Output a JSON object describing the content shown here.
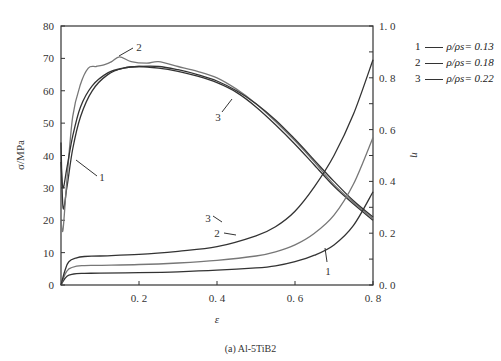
{
  "chart_data": {
    "type": "line",
    "title": "",
    "caption": "(a) Al-5TiB2",
    "xlabel": "ε",
    "ylabel": "σ/MPa",
    "y2label": "η",
    "xlim": [
      0,
      0.8
    ],
    "ylim": [
      0,
      80
    ],
    "y2lim": [
      0,
      1.0
    ],
    "xticks": [
      "0.2",
      "0.4",
      "0.6",
      "0.8"
    ],
    "yticks": [
      "0",
      "10",
      "20",
      "30",
      "40",
      "50",
      "60",
      "70",
      "80"
    ],
    "y2ticks": [
      "0.0",
      "0.2",
      "0.4",
      "0.6",
      "0.8",
      "1.0"
    ],
    "grid": false,
    "legend_position": "right-outside-top",
    "legend": [
      {
        "id": "1",
        "label": "ρ/ρs= 0.13"
      },
      {
        "id": "2",
        "label": "ρ/ρs= 0.18"
      },
      {
        "id": "3",
        "label": "ρ/ρs= 0.22"
      }
    ],
    "series": [
      {
        "name": "1 σ (ρ/ρs=0.13)",
        "axis": "left",
        "color": "#333333",
        "x": [
          0.0,
          0.005,
          0.015,
          0.03,
          0.05,
          0.08,
          0.12,
          0.16,
          0.2,
          0.25,
          0.3,
          0.35,
          0.4,
          0.45,
          0.5,
          0.55,
          0.6,
          0.65,
          0.7,
          0.75,
          0.8
        ],
        "values": [
          44,
          24,
          30,
          42,
          52,
          60,
          65,
          67,
          67.5,
          67,
          66,
          64.5,
          62.5,
          59.5,
          55,
          49.5,
          43.5,
          37,
          30.5,
          25,
          20
        ]
      },
      {
        "name": "2 σ (ρ/ρs=0.18)",
        "axis": "left",
        "color": "#777777",
        "x": [
          0.0,
          0.005,
          0.015,
          0.03,
          0.05,
          0.07,
          0.09,
          0.11,
          0.13,
          0.15,
          0.18,
          0.22,
          0.25,
          0.3,
          0.35,
          0.4,
          0.45,
          0.5,
          0.55,
          0.6,
          0.65,
          0.7,
          0.75,
          0.8
        ],
        "values": [
          20,
          17,
          32,
          52,
          62,
          67,
          67.5,
          68,
          69,
          70.5,
          69,
          68.5,
          69,
          67.5,
          66,
          64,
          60.5,
          56,
          50.5,
          44.5,
          38,
          31,
          25.5,
          20.5
        ]
      },
      {
        "name": "3 σ (ρ/ρs=0.22)",
        "axis": "left",
        "color": "#333333",
        "x": [
          0.0,
          0.005,
          0.015,
          0.03,
          0.05,
          0.08,
          0.12,
          0.16,
          0.2,
          0.25,
          0.3,
          0.35,
          0.4,
          0.45,
          0.5,
          0.55,
          0.6,
          0.65,
          0.7,
          0.75,
          0.8
        ],
        "values": [
          38,
          30,
          36,
          46,
          55,
          61.5,
          65.5,
          67,
          67.5,
          67.5,
          66.5,
          65,
          63,
          60,
          56,
          51,
          45,
          38.5,
          32,
          26,
          21
        ]
      },
      {
        "name": "1 η (ρ/ρs=0.13)",
        "axis": "right",
        "color": "#333333",
        "x": [
          0.0,
          0.01,
          0.02,
          0.04,
          0.06,
          0.1,
          0.2,
          0.3,
          0.4,
          0.5,
          0.55,
          0.6,
          0.65,
          0.7,
          0.75,
          0.8
        ],
        "values": [
          0.0,
          0.025,
          0.038,
          0.044,
          0.045,
          0.046,
          0.048,
          0.051,
          0.057,
          0.066,
          0.074,
          0.09,
          0.115,
          0.155,
          0.23,
          0.36
        ]
      },
      {
        "name": "2 η (ρ/ρs=0.18)",
        "axis": "right",
        "color": "#777777",
        "x": [
          0.0,
          0.01,
          0.02,
          0.04,
          0.06,
          0.1,
          0.2,
          0.3,
          0.4,
          0.5,
          0.55,
          0.6,
          0.65,
          0.7,
          0.75,
          0.8
        ],
        "values": [
          0.0,
          0.04,
          0.062,
          0.073,
          0.075,
          0.076,
          0.079,
          0.085,
          0.095,
          0.112,
          0.128,
          0.155,
          0.2,
          0.27,
          0.39,
          0.57
        ]
      },
      {
        "name": "3 η (ρ/ρs=0.22)",
        "axis": "right",
        "color": "#333333",
        "x": [
          0.0,
          0.01,
          0.02,
          0.04,
          0.06,
          0.1,
          0.2,
          0.3,
          0.4,
          0.5,
          0.55,
          0.6,
          0.65,
          0.7,
          0.75,
          0.8
        ],
        "values": [
          0.0,
          0.055,
          0.09,
          0.105,
          0.11,
          0.112,
          0.118,
          0.13,
          0.148,
          0.19,
          0.225,
          0.285,
          0.38,
          0.5,
          0.66,
          0.87
        ]
      }
    ],
    "annotations": [
      {
        "text": "1",
        "target": "σ curve 1",
        "at": [
          0.11,
          38
        ]
      },
      {
        "text": "2",
        "target": "σ curve 2",
        "at": [
          0.2,
          75
        ]
      },
      {
        "text": "3",
        "target": "σ curve 3",
        "at": [
          0.39,
          52
        ]
      },
      {
        "text": "3",
        "target": "η curve 3",
        "at": [
          0.5,
          0.25
        ]
      },
      {
        "text": "2",
        "target": "η curve 2",
        "at": [
          0.55,
          0.17
        ]
      },
      {
        "text": "1",
        "target": "η curve 1",
        "at": [
          0.6,
          0.04
        ]
      }
    ]
  }
}
